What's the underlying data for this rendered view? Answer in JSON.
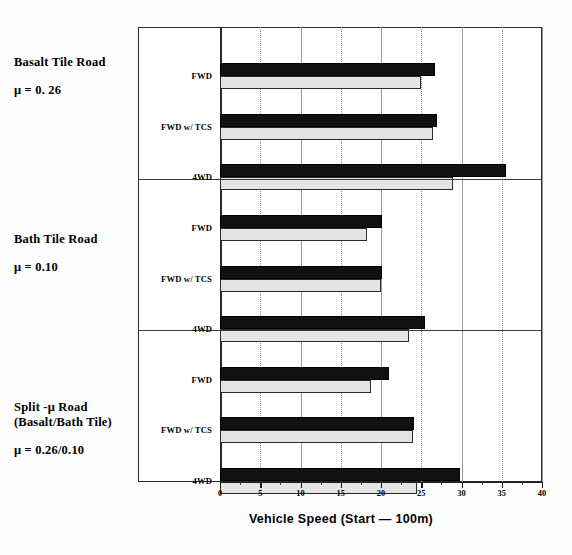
{
  "chart_data": {
    "type": "bar",
    "orientation": "horizontal",
    "title": "",
    "xlabel": "Vehicle Speed (Start — 100m)",
    "ylabel": "",
    "xlim": [
      0,
      40
    ],
    "xticks": [
      0,
      5,
      10,
      15,
      20,
      25,
      30,
      35,
      40
    ],
    "xtick_labels": [
      "0",
      "5",
      "10",
      "15",
      "20",
      "25",
      "30",
      "35",
      "40"
    ],
    "minor_tick_step": 2.5,
    "grid": "vertical-dotted",
    "legend": "none",
    "categories": [
      "FWD",
      "FWD w/ TCS",
      "4WD"
    ],
    "series": [
      {
        "name": "dark",
        "color": "#111111"
      },
      {
        "name": "light",
        "color": "#e4e4e4"
      }
    ],
    "groups": [
      {
        "id": "basalt",
        "caption": "Basalt Tile Road",
        "mu": "μ = 0. 26",
        "rows": [
          {
            "category": "FWD",
            "dark": 26.7,
            "light": 25.0
          },
          {
            "category": "FWD w/ TCS",
            "dark": 26.9,
            "light": 26.4
          },
          {
            "category": "4WD",
            "dark": 35.5,
            "light": 29.0
          }
        ]
      },
      {
        "id": "bath",
        "caption": "Bath Tile Road",
        "mu": "μ = 0.10",
        "rows": [
          {
            "category": "FWD",
            "dark": 20.1,
            "light": 18.3
          },
          {
            "category": "FWD w/ TCS",
            "dark": 20.1,
            "light": 20.0
          },
          {
            "category": "4WD",
            "dark": 25.5,
            "light": 23.5
          }
        ]
      },
      {
        "id": "split",
        "caption": "Split -μ Road\n(Basalt/Bath Tile)",
        "mu": "μ =  0.26/0.10",
        "rows": [
          {
            "category": "FWD",
            "dark": 21.0,
            "light": 18.7
          },
          {
            "category": "FWD w/ TCS",
            "dark": 24.1,
            "light": 24.0
          },
          {
            "category": "4WD",
            "dark": 29.8,
            "light": 24.5
          }
        ]
      }
    ]
  },
  "colors": {
    "dark_bar": "#111111",
    "light_bar": "#e4e4e4",
    "frame": "#2b2b2b",
    "grid": "#8d8d8d",
    "text": "#000000",
    "background": "#ffffff"
  }
}
